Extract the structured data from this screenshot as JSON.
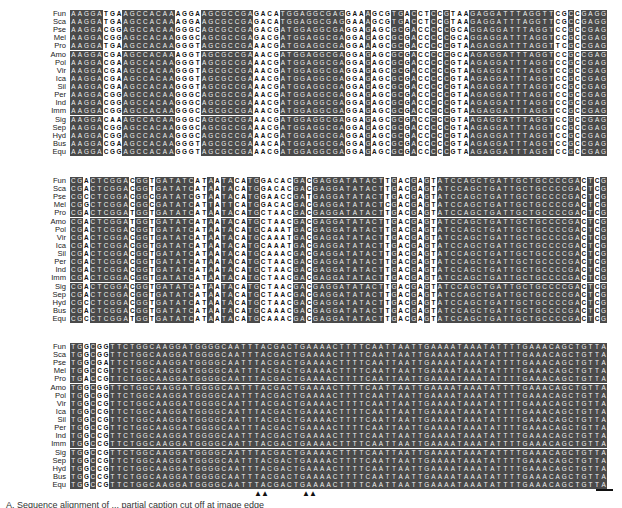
{
  "figure": {
    "species_labels": [
      "Fun",
      "Sca",
      "Pse",
      "Mel",
      "Pro",
      "Amo",
      "Pol",
      "Vir",
      "Ica",
      "Sil",
      "Per",
      "Ind",
      "Imm",
      "Sig",
      "Sep",
      "Hyd",
      "Bus",
      "Equ"
    ],
    "blocks": [
      {
        "top": 10,
        "rows": [
          "AAGGATGAAGCCACAAAGGAAGCGCCGAGACATGGAGGCGAGGAAAGCGTGACCTCCGTAAGAGGATTTAGGTTCGCCGAGGAACTACACGAGGAGGCGAAGCGAGGAAGGC",
          "AAGGATGAAGCCACAAAGGAAGCGCCGAGACATGGAGGCGAGGAAAGCGTGACCTCCGTAAGAGGATTTAGGTTCGCCGAGGAACTACACGAGGAGGCGAAGCGAGGAAGGC",
          "AAGGACGGAGCCACAAGGGCAGCGCCGAGACGATGGAGGCGAGGAGAGCGCGACCCCCGCAGGAGGATTTAGGTCCGCCGAGGAGCTCACGAGGAGGCGAAGTGAGGAGGGC",
          "AAGGACGGAGCCACAAGGGCAGCGCCGAGACGATGGAGGCGAGGAGAGCGCGACCCCCGCAGGAGGATTTAGGTCCGCCGAGGAACTGACGAGGAGGCGAAGCGAGGAGGGC",
          "AAGGATGAAGCCACAAGGGTAGCGCCGAAACGATGGAGGCGAGGAAAGCGCGACCCCCGTAAGAGGATTTAGGTTCGCCGAGGAATTACACGAGGAGGCGAAGCGAGGAAGGC",
          "AAGGACGAAGCCACAAAGGTAGCGCCGAAACGATGGAGGCGAGGAGAGCGCGACCCCCGCAAGAGGATTTAGGTCCGCCGAGGAACTACACGAGGAGGCGAAGCGAGGAGGGC",
          "AAGGACGAAGCCACAAGGGTAGCGCCGAAACGATGGAGGCGAGGAGAGCGCGACCCCCGTAAGAGGATTTAGGTCCGCCGAGGAACTACACGAGGAGGCGAAGCGAGGAGGGC",
          "AAGGACGAAGCCACAAGGGTAGCGCCGAAACGATGGAGGCGAGGAGAGCGCGACCCCCGTAAGAGGATTTAGGTCCGCCGAGGAACTACACGAGGAGGCGAAGCGAGGAGGGC",
          "AAGGACGAAGCCACAAGGGTAGCGCCGAAACGATGGAGGCGAGGAGAGCGCGACCCCCGTAAGAGGATTTAGGTCCGCCGAGGAACTACACGAGGAGGCGAAGCGAGGAGGGC",
          "AAGGACGAAGCCACAAGGGTAGCGCCGAAACGATGGAGGCGAGGAGAGCGCGACCCCCGTAAGAGGATTTAGGTCCGCCGAGGAACTACACGAGGAGGCGAAGCGAGGAGGGC",
          "AAGGACGGAGCCACAAGGGCAGCGCCGAAACGATGGAGGCGAGGAGAGCGCGACCCCCGTAAGAGGATTTAGGTCCGCCGAGGAACTACACGAGGAGGCGAAGCGAGGAGGGC",
          "AAGGACGGAGCCACAAGGGCAGCGCCGAAACGATGGAGGCGAGGAGAGCGCGACCCCCGTAAGAGGATTTAGGTCCGCCGAGGAACTACACGAGGAGGCGAAGCGAGGAGGGC",
          "AAGGACGGAGCCACAAGGGCAGCGCCGAAACGATGGAGGCGAGGAGAGCGCGACCCCCGTAAGAGGATTTAGGTCCGCCGAGGAACTACACGAGGAGGCGAAGCGAGGAGGGC",
          "AAGGACAAAGCCACAAGGGCAGCGCCGAAACGATGGAGGCGAGGAGAGCGCGACCCCCGTAAGAGGATTTAGGTCCGCCGAGGAACTACACGAGGAGGCGAAGCGAGGAGGGC",
          "AAGGACGGAGCCACAAGGGCAGCGCCGAAACGATGGAGGCGAGGAGAGCGCGACCCCCGTAAGAGGATTTAGGTCCGCCGAGGAACTACACGAGGAGGCGAAGCGAGGAGGGC",
          "AAGGACGGAGCCACAAGGGCAGCGCCGAAACGATGGAGGCGAGGAGAGCGCGACCCCCGTAAGAGGATTTAGGTCCGCCGAGGAACTACACGAGGAGGCGAAGCGAGGAGGGC",
          "AAGGACGAAGCCACAAGGGTAGCGCCGAAACAATGGAGGCGAGGAGAGCGCGACCCCCGTAAGAGGATTTAGGTCCGCCGAGGAACTACACGAGGAGGCGAAGCGAGGAGGGC",
          "AAGGACGGAGCCACAAGGGTAGCGCCGAAACGATGGAGGCGAGGAGAGCGCGACCCCCGTAAGAGGATTTAGGTCCGCCGAGGAATTACACGAGGAGGCGAAGCGAGGAGGGC"
        ],
        "variable_columns": [
          5,
          6,
          7,
          16,
          17,
          18,
          19,
          28,
          29,
          30,
          31,
          42,
          43,
          44,
          46,
          47,
          48,
          51,
          53,
          54,
          56,
          58,
          59,
          60,
          74,
          75,
          77,
          86,
          87,
          88,
          98,
          99,
          100,
          101,
          102,
          108,
          109
        ]
      },
      {
        "top": 177,
        "rows": [
          "CGACTCGGACGGTGATATCATAATACATGGACACGACGAGGATATACTTGACGAGTATCCAGCTGATTGCTGCCCCGACTCGTACTATAAGAAATTTCCAATATTAGCTGGCGATGATGAT",
          "CGACTCGGACGGTGATATCATAATACATGGACACGACGAGGATATACTTGACGAGTATCCAGCTGATTGCTGCCCCGACTCGTACTATAAGAAATTTCCAATATTAGCTGGCGATGATGAT",
          "CGCCTCGGACGGCGATATCGTAATACATGGAACCGATGAGGATATACTTGACGAGTATCCAGCTGATTGCTGCCCCGACTCGTACTATAAGAAATTTCCGATCTTAGCCGGTGATGATGAC",
          "CGGCTCGGACGGCGATATCATTATTCATGGACACGACGAGGATATACTCGACGAGTATCCAGCTGATTGCTGCCCCGACTCGTACTATAAGAAATTTCCGATCTTAGCCGGTGACGATGAC",
          "CGACTCGGATGGTGATATCATAATACATGCTAACGACGAGGATATACTTGACGAGTATCCAGCTGATTGCTGCCCCGACTCGTACTATAAGAAATTTCCAATCTTAGCTGGCGATGATGAT",
          "CGACTCGGATGGTGATATCATAATACATGCTAACGACGAGGATATACTTGACGAGTATCCAGCTGATTGCTGCCCCGACTCGTACTATAAGAAATTTCCAATCTTAGCTGGCGATGATGAT",
          "CGACTCGGACGGTGATATCATAATACATGCAAATGACGAGGATATACTTGACGAGTATCCAGCTGATTGCTGCCCCGACTCGTACTATAAGAAATTTCCAATCTTAGCTGGCGATGATGAT",
          "CGACTCGGACGGTGATATCATAATACATGCAAATGACGAGGATATACTTGACGAGTATCCAGCTGATTGCTGCCCCGACTCGTACTATAAGAAATTTCCAATCTTAGCTGGCGATGATGAT",
          "CGACTCGGACGGTGATATCATAATACATGCAAATGACGAGGATATACTTGACGAGTATCCAGCTGATTGCTGCCCCGACTCGTACTATAAGAAATTTCCAATCTTAGCTGGCGATGATGAT",
          "CGACTCGGACGGTGATATCATAATACATGCAAACGACGAGGATATACTTGACGAGTATCCAGCTGATTGCTGCCCCGACTCGTACTATAAGAAATTTCCAATCTTAGCTGGCGATGATGAT",
          "CGACTCGGACGGTGATATCATAATACATGCTAACGACGAGGATATACTTGACGAGTATCCAGCTGATTGCTGCCCCGACTCGTACTATAAGAAATTTCCAATCTTAGCTGGCGATGATGAT",
          "CGACTCGGACGGTGATATCATAATACATGCTAACGACGAGGATATACTTGACGAGTATCCAGCTGATTGCTGCCCCGACTCGTACTATAAGAAATTTCCAATCTTAGCTGGCGATGATGAT",
          "CGACTCGGACGGTGATATCATAATACATGCTAACGACGAGGATATACTTGACGAGTATCCAGCTGATTGCTGCCCCGACTCGTACTATAAGAAATTTCCAATCTTAGCTGGCGATGATGAT",
          "CGACTCGGACGGTGATATCATAATACATGCTAACGACGAGGATATACTTGACGAGTATCCAGCTGATTGCTGCCCCGACTCGTACTATAAGAAATTTCCAATCTTAGCTGGCGATGATGAT",
          "CGACTCGGACGGTGATATCATAATACATGCTAACGACGAGGATATACTTGACGAGTATCCAGCTGATTGCTGCCCCGACTCGTACTATAAGAAATTTCCAATCTTAGCTGGCGATGATGAT",
          "CGCCTCGGACGGTGATATCATAATACATGCTAACGACGAGGATATACTTGACGAGTATCCAGCTGATTGCTGCCCCGACTCGTACTATAAGAAATTTCCAATCTTAGCTGGCGATGATGAT",
          "CGACTCGGACGGTGATATCATAATACATGCAAACGACGAGGATATACTTGACGAGTATCCAGCTGATTGCTGCCCCGACTCGTACTATAAGAAATTTCCAATCTTAGCTGGCGATGATGAT",
          "CGCCTCGGATGGTGATATCATAATACATGCAAACGACGAGGATATACTTGACGAGTATCCAGCTGATTGCTGCCCCGACTCGTACTATAAGAAATTTCCAATCTTAGCTGGCGATGATGAT"
        ],
        "variable_columns": [
          2,
          9,
          12,
          19,
          20,
          22,
          25,
          26,
          29,
          30,
          31,
          32,
          33,
          36,
          48,
          50,
          51,
          53,
          55,
          78,
          80,
          101,
          103,
          104,
          110,
          111,
          112,
          113,
          115,
          117,
          119
        ]
      },
      {
        "top": 343,
        "rows": [
          "TGGCGGTTCTGGCAAGGATGGGGCAATTTACGACTGAAAACTTTTCAATTAATTGAAAATAAATATTTTGAAACAGCTGTTATCACTATGATTTTAATGAGTAGCTTAGCTTTGGTAAG",
          "TGGCGGTTCTGGCAAGGATGGGGCAATTTACGACTGAAAACTTTTCAATTAATTGAAAATAAATATTTTGAAACAGCTGTTATCACTATGATTTTAATGAGTAGCTTAGCTTTGGTAAG",
          "TGGCGATTCTGGCAAGGATGGGGCAATTTACGACTGAAAACTTTTCAATTAATTGAAAATAAATATTTTGAAACAGCTGTTATCACTATGATTTTAATGAGTAGCTTAGCTTTGGTAAG",
          "TGGCCGTTCTGGCAAGGATGGGGCAATTTACGACTGAAAACTTTTCAATTAATTGAAAATAAATATTTTGAAACAGCTGTTATCACTATGATTTTAATGAGTAGCTTAGCTTTGGTAAG",
          "TGACCGTTCTGGCAAGGATGGGGCAATTTACGACTGAAAACTTTTCAATTAATTGAAAATAAATATTTTGAAACAGCTGTTATCACTATGATTTTAATGAGTAGCTTAGCTTTGGTAAG",
          "TGGCGGTTCTGGCAAGGATGGGGCAATTTACGACTGAAAACTTTTCAATTAATTGAAAATAAATATTTTGAAACAGCTGTTATCACTATGATTTTAATGAGTAGCTTAGCTTTGGTAAG",
          "TGGCGGTTCTGGCAAGGATGGGGCAATTTACGACTGAAAACTTTTCAATTAATTGAAAATAAATATTTTGAAACAGCTGTTATCACTATGATTTTAATGAGTAGCTTAGCTTTGGTAAG",
          "TGGCCGTTCTGGCAAGGATGGGGCAATTTACGACTGAAAACTTTTCAATTAATTGAAAATAAATATTTTGAAACAGCTGTTATCACTATGATTTTAATGAGTAGCTTAGCTTTGGTAAG",
          "TGGCCGTTCTGGCAAGGATGGGGCAATTTACGACTGAAAACTTTTCAATTAATTGAAAATAAATATTTTGAAACAGCTGTTATCACTATGATTTTAATGAGTAGCTTAGCTTTGGTAAG",
          "TGGCCGTTCTGGCAAGGATGGGGCAATTTACGACTGAAAACTTTTCAATTAATTGAAAATAAATATTTTGAAACAGCTGTTATCACTATGATTTTAATGAGTAGCTTAGCTTTGGTAAG",
          "TGGCCGTTCTGGCAAGGATGGGGCAATTTACGACTGAAAACTTTTCAATTAATTGAAAATAAATATTTTGAAACAGCTGTTATCACTATGATTTTAATGAGTAGCTTAGCTTTGGTAAG",
          "TGGCCGTTCTGGCAAGGATGGGGCAATTTACGACTGAAAACTTTTCAATTAATTGAAAATAAATATTTTGAAACAGCTGTTATCACTATGATTTTAATGAGTAGCTTAGCTTTGGTAAG",
          "TGGCCGTTCTGGCAAGGATGGGGCAATTTACGACTGAAAACTTTTCAATTAATTGAAAATAAATATTTTGAAACAGCTGTTATCACTATGATTTTAATGAGTAGCTTAGCTTTGGTAAG",
          "TGGCCGTTCTGGCAAGGATGGGGCAATTTACGACTGAAAACTTTTCAATTAATTGAAAATAAATATTTTGAAACAGCTGTTATCACTATGATTTTAATGAGTAGCTTAGCTTTGGTAAG",
          "TGGCCGTTCTGGCAAGGATGGGGCAATTTACGACTGAAAACTTTTCAATTAATTGAAAATAAATATTTTGAAACAGCTGTTATCACTATGATTTTAATGAGTAGCTTAGCTTTGGTAAG",
          "TGGCCGTTCTGGCAAGGATGGGGCAATTTACGACTGAAAACTTTTCAATTAATTGAAAATAAATATTTTGAAACAGCTGTTATCACTATGATTTTAATGAGTAGCTTAGCTTTGGTAAG",
          "TGGCCGTTCTGGCAAGGATGGGGCAATTTACGACTGAAAACTTTTCAATTAATTGAAAATAAATATTTTGAAACAGCTGTTATCACTATGATTTTAATGAGTAGCTTAGCTTTGGTAAG",
          "TGGCCGTTCTGGCAAGGATGGGGCAATTTACGACTGAAAACTTTTCAATTAATTGAAAATAAATATTTTGAAACAGCTGTTATCACTATGATTTTAATGAGTAGCTTAGCTTTGGTAAG"
        ],
        "variable_columns": [
          2,
          4,
          5
        ]
      }
    ],
    "markers": {
      "arrowheads": [
        {
          "left": 254,
          "glyph": "▲▲"
        },
        {
          "left": 302,
          "glyph": "▲▲"
        }
      ],
      "scale_bar": true
    },
    "caption": "A. Sequence alignment of ... partial caption cut off at image edge"
  }
}
